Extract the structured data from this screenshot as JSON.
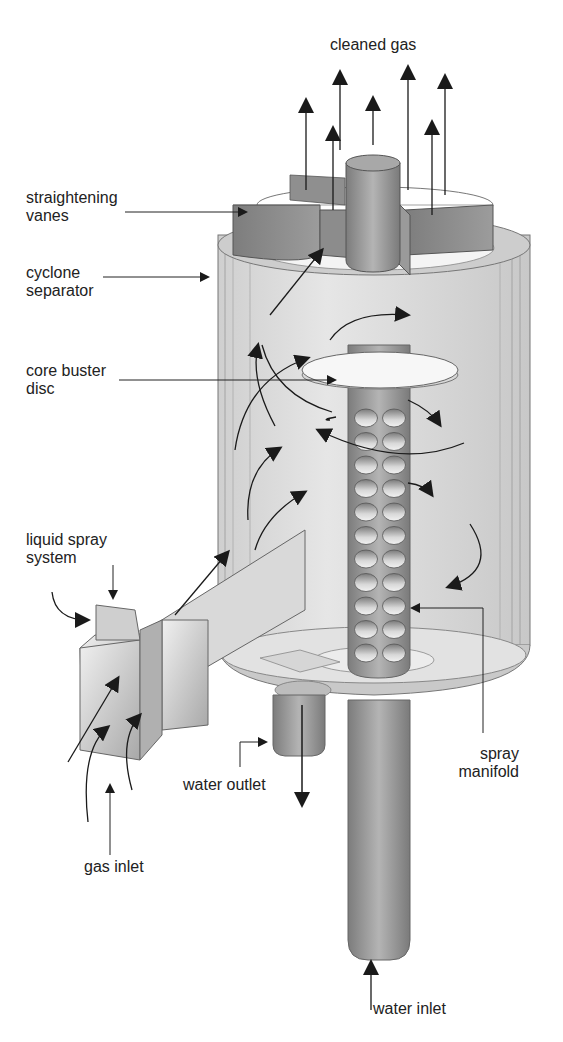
{
  "figure": {
    "colors": {
      "background": "#ffffff",
      "text": "#222222",
      "vessel_fill": "#dcdcdc",
      "vessel_stroke": "#6e6e6e",
      "vane_fill": "#8a8a8a",
      "manifold_fill": "#8f8f8f",
      "nozzle_fill": "#c4c4c4",
      "pipe_fill": "#9a9a9a",
      "arrow": "#1a1a1a"
    }
  },
  "labels": {
    "cleaned_gas": "cleaned gas",
    "straightening_vanes": [
      "straightening",
      "vanes"
    ],
    "cyclone_separator": [
      "cyclone",
      "separator"
    ],
    "core_buster_disc": [
      "core buster",
      "disc"
    ],
    "liquid_spray_system": [
      "liquid spray",
      "system"
    ],
    "spray_manifold": [
      "spray",
      "manifold"
    ],
    "water_outlet": "water outlet",
    "gas_inlet": "gas inlet",
    "water_inlet": "water inlet"
  },
  "manifold": {
    "nozzle_rows": 11,
    "nozzle_columns": 2
  },
  "outlet_arrows": 7
}
